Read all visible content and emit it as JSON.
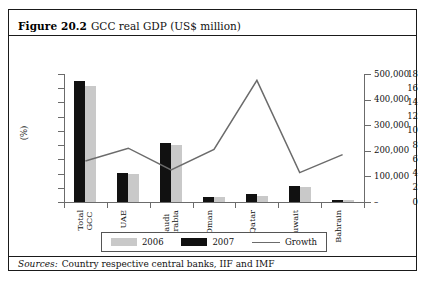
{
  "figure": {
    "label": "Figure 20.2",
    "title": "GCC real GDP (US$ million)",
    "source_label": "Sources:",
    "source_text": "Country respective central banks, IIF and IMF"
  },
  "legend": {
    "items": [
      {
        "name": "2006",
        "swatch": "light-gray-bar"
      },
      {
        "name": "2007",
        "swatch": "black-bar"
      },
      {
        "name": "Growth",
        "swatch": "gray-line"
      }
    ]
  },
  "axes": {
    "left_title": "(%)",
    "left_ticks": [
      "0",
      "2",
      "4",
      "6",
      "8",
      "10",
      "12",
      "14",
      "16",
      "18"
    ],
    "right_ticks": [
      "–",
      "100,000",
      "200,000",
      "300,000",
      "400,000",
      "500,000"
    ]
  },
  "colors": {
    "bar_2006": "#c9c9c9",
    "bar_2007": "#111111",
    "growth_line": "#6b6b6b",
    "axis": "#6b6b6b",
    "border": "#1a1a1a"
  },
  "chart_data": {
    "type": "bar",
    "title": "GCC real GDP (US$ million)",
    "xlabel": "",
    "ylabel": "(%)",
    "y2label": "US$ million",
    "ylim": [
      0,
      18
    ],
    "y2lim": [
      0,
      500000
    ],
    "yticks": [
      0,
      2,
      4,
      6,
      8,
      10,
      12,
      14,
      16,
      18
    ],
    "y2ticks": [
      0,
      100000,
      200000,
      300000,
      400000,
      500000
    ],
    "grid": false,
    "legend_position": "bottom",
    "categories": [
      "Total GCC",
      "UAE",
      "Saudi Arabia",
      "Oman",
      "Qatar",
      "Kuwait",
      "Bahrain"
    ],
    "series": [
      {
        "name": "2007",
        "type": "bar",
        "axis": "left",
        "color": "#111111",
        "values": [
          17.0,
          4.1,
          8.3,
          0.75,
          1.15,
          2.25,
          0.35
        ]
      },
      {
        "name": "2006",
        "type": "bar",
        "axis": "left",
        "color": "#c9c9c9",
        "values": [
          16.3,
          4.0,
          8.0,
          0.65,
          0.9,
          2.1,
          0.3
        ]
      },
      {
        "name": "Growth",
        "type": "line",
        "axis": "right",
        "color": "#6b6b6b",
        "values": [
          160000,
          210000,
          125000,
          205000,
          475000,
          115000,
          185000
        ]
      }
    ]
  }
}
